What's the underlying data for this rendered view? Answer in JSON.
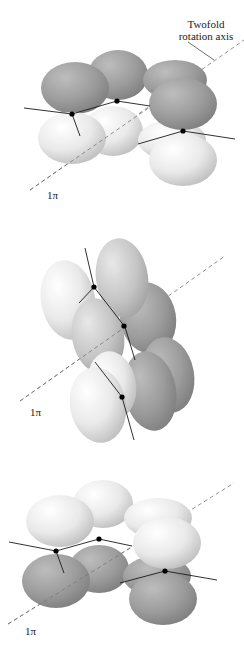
{
  "figure": {
    "axis_label_line1": "Twofold",
    "axis_label_line2": "rotation axis",
    "panels": [
      {
        "id": "top",
        "pi_label": "1π"
      },
      {
        "id": "middle",
        "pi_label": "1π"
      },
      {
        "id": "bottom",
        "pi_label": "1π"
      }
    ]
  },
  "colors": {
    "dark_subunit": "#9a9a9a",
    "light_subunit": "#e6e6e6",
    "line": "#1a1a1a",
    "dashed_axis": "#777777"
  }
}
